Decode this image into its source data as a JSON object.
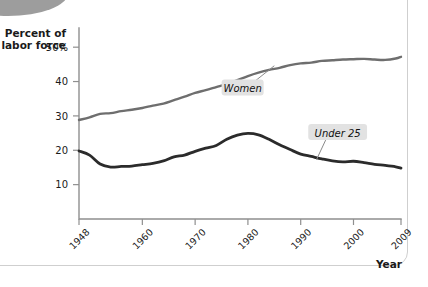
{
  "figure": {
    "background_color": "#ffffff",
    "frame_color": "#cfcfcf",
    "corner_ornament": "gray-oval"
  },
  "chart_data": {
    "type": "line",
    "title": "",
    "subtitle": "",
    "ylabel_line1": "Percent of",
    "ylabel_line2": "labor force",
    "xlabel": "Year",
    "xlim": [
      1948,
      2009
    ],
    "ylim": [
      0,
      55
    ],
    "grid": false,
    "legend_position": "inline-callout",
    "y_ticks": [
      10,
      20,
      30,
      40,
      50
    ],
    "y_tick_labels": [
      "10",
      "20",
      "30",
      "40",
      "50%"
    ],
    "x_ticks": [
      1948,
      1960,
      1970,
      1980,
      1990,
      2000,
      2009
    ],
    "x_tick_labels": [
      "1948",
      "1960",
      "1970",
      "1980",
      "1990",
      "2000",
      "2009"
    ],
    "series": [
      {
        "name": "Women",
        "color": "#6e6e6e",
        "line_width": 2.4,
        "label_x": 1979,
        "label_y": 38.0,
        "anchor_x": 1985,
        "anchor_y": 44.6,
        "x": [
          1948,
          1950,
          1952,
          1954,
          1956,
          1958,
          1960,
          1962,
          1964,
          1966,
          1968,
          1970,
          1972,
          1974,
          1976,
          1978,
          1980,
          1982,
          1984,
          1986,
          1988,
          1990,
          1992,
          1994,
          1996,
          1998,
          2000,
          2002,
          2004,
          2006,
          2008,
          2009
        ],
        "y": [
          28.8,
          29.6,
          30.6,
          30.8,
          31.4,
          31.8,
          32.3,
          33.0,
          33.6,
          34.6,
          35.6,
          36.7,
          37.5,
          38.4,
          39.3,
          40.4,
          41.6,
          42.6,
          43.4,
          44.0,
          44.8,
          45.3,
          45.5,
          46.0,
          46.2,
          46.4,
          46.5,
          46.6,
          46.4,
          46.3,
          46.7,
          47.2
        ]
      },
      {
        "name": "Under 25",
        "color": "#2b2b2b",
        "line_width": 2.8,
        "label_x": 1997,
        "label_y": 25.0,
        "anchor_x": 1993,
        "anchor_y": 17.3,
        "x": [
          1948,
          1950,
          1952,
          1954,
          1956,
          1958,
          1960,
          1962,
          1964,
          1966,
          1968,
          1970,
          1972,
          1974,
          1976,
          1978,
          1980,
          1982,
          1984,
          1986,
          1988,
          1990,
          1992,
          1994,
          1996,
          1998,
          2000,
          2002,
          2004,
          2006,
          2008,
          2009
        ],
        "y": [
          19.8,
          18.6,
          16.0,
          15.1,
          15.3,
          15.4,
          15.8,
          16.2,
          16.9,
          18.1,
          18.6,
          19.7,
          20.6,
          21.4,
          23.2,
          24.4,
          24.9,
          24.5,
          23.2,
          21.6,
          20.2,
          18.9,
          18.2,
          17.5,
          16.9,
          16.6,
          16.8,
          16.4,
          15.9,
          15.6,
          15.2,
          14.8
        ]
      }
    ]
  }
}
